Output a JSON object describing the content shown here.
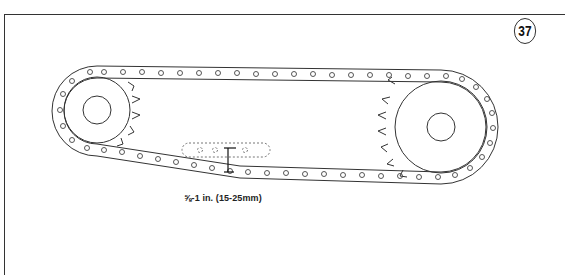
{
  "figure": {
    "number": "37",
    "caption": "⅝-1 in. (15-25mm)"
  },
  "diagram": {
    "small_sprocket": {
      "cx": 97,
      "cy": 110,
      "r": 35,
      "hub_r": 14,
      "teeth": 5
    },
    "large_sprocket": {
      "cx": 441,
      "cy": 127,
      "r": 47,
      "hub_r": 14,
      "teeth": 7
    },
    "chain_slack_indicator": {
      "x": 228,
      "y_top": 148,
      "y_bottom": 172
    },
    "colors": {
      "line": "#333333",
      "dashed": "#777777",
      "background": "#ffffff"
    }
  }
}
